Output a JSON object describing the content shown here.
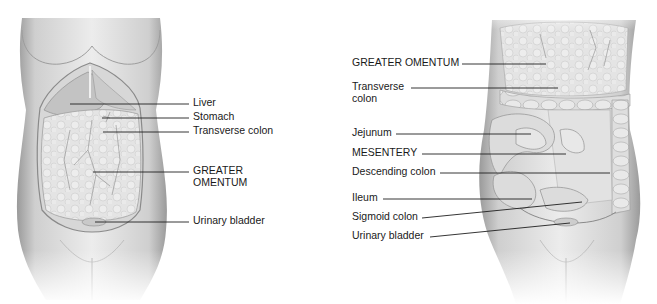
{
  "figure": {
    "background": "#ffffff",
    "line_color": "#1f1f1f",
    "text_color": "#1a1a1a",
    "panels": [
      {
        "name": "left",
        "description": "Anterior view of abdomen with greater omentum in place",
        "labels": [
          {
            "id": "liver",
            "text": "Liver"
          },
          {
            "id": "stomach",
            "text": "Stomach"
          },
          {
            "id": "transverse-colon",
            "text": "Transverse colon"
          },
          {
            "id": "greater-omentum",
            "line1": "GREATER",
            "line2": "OMENTUM"
          },
          {
            "id": "urinary-bladder",
            "text": "Urinary bladder"
          }
        ]
      },
      {
        "name": "right",
        "description": "Anterior view with greater omentum lifted exposing intestines",
        "labels": [
          {
            "id": "greater-omentum",
            "text": "GREATER OMENTUM"
          },
          {
            "id": "transverse-colon",
            "line1": "Transverse",
            "line2": "colon"
          },
          {
            "id": "jejunum",
            "text": "Jejunum"
          },
          {
            "id": "mesentery",
            "text": "MESENTERY"
          },
          {
            "id": "descending-colon",
            "text": "Descending colon"
          },
          {
            "id": "ileum",
            "text": "Ileum"
          },
          {
            "id": "sigmoid-colon",
            "text": "Sigmoid colon"
          },
          {
            "id": "urinary-bladder",
            "text": "Urinary bladder"
          }
        ]
      }
    ]
  }
}
